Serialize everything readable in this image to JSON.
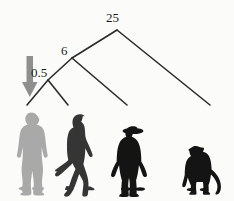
{
  "diagram": {
    "type": "phylogenetic-tree",
    "time_unit": "million years ago",
    "background_color": "#fbfbf9",
    "branch_color": "#2b2b2b",
    "arrow_color": "#8c8c8c",
    "nodes": [
      {
        "id": "root",
        "label": "25",
        "x": 117,
        "y": 30,
        "label_x": 106,
        "label_y": 11
      },
      {
        "id": "node6",
        "label": "6",
        "x": 72,
        "y": 58,
        "label_x": 61,
        "label_y": 44
      },
      {
        "id": "node05",
        "label": "0.5",
        "x": 48,
        "y": 80,
        "label_x": 31,
        "label_y": 66
      }
    ],
    "branches": [
      {
        "from": "root",
        "to": "tip-monkey",
        "x1": 117,
        "y1": 30,
        "x2": 210,
        "y2": 105
      },
      {
        "from": "root",
        "to": "node6",
        "x1": 117,
        "y1": 30,
        "x2": 72,
        "y2": 58
      },
      {
        "from": "node6",
        "to": "tip-chimp",
        "x1": 72,
        "y1": 58,
        "x2": 127,
        "y2": 105
      },
      {
        "from": "node6",
        "to": "node05",
        "x1": 72,
        "y1": 58,
        "x2": 48,
        "y2": 80
      },
      {
        "from": "node05",
        "to": "tip-human",
        "x1": 48,
        "y1": 80,
        "x2": 27,
        "y2": 105
      },
      {
        "from": "node05",
        "to": "tip-hominid",
        "x1": 48,
        "y1": 80,
        "x2": 68,
        "y2": 105
      }
    ],
    "arrow": {
      "name": "divergence-pointer-arrow",
      "points_to": "node05",
      "shaft_x": 30,
      "shaft_top_y": 57,
      "shaft_bottom_y": 82,
      "tip_x": 30,
      "tip_y": 96,
      "color": "#8c8c8c"
    },
    "silhouettes": [
      {
        "id": "modern-human",
        "label": "modern human",
        "color": "#a9a9a9",
        "x": 10,
        "y": 112,
        "w": 44,
        "h": 78
      },
      {
        "id": "walking-hominid",
        "label": "walking hominid",
        "color": "#3a3a3a",
        "x": 56,
        "y": 114,
        "w": 46,
        "h": 76
      },
      {
        "id": "chimpanzee",
        "label": "chimpanzee",
        "color": "#171717",
        "x": 115,
        "y": 126,
        "w": 36,
        "h": 64
      },
      {
        "id": "monkey",
        "label": "monkey",
        "color": "#171717",
        "x": 182,
        "y": 145,
        "w": 34,
        "h": 45
      }
    ]
  }
}
